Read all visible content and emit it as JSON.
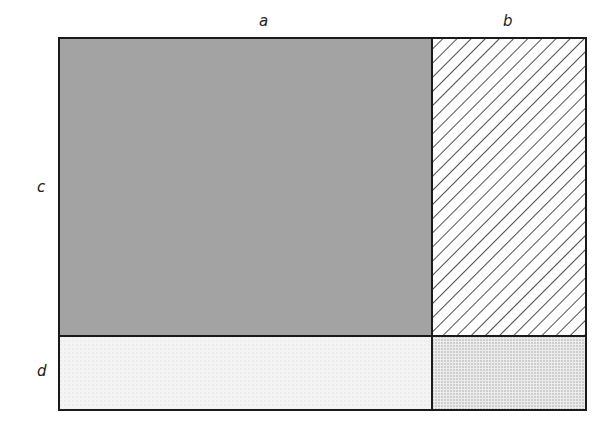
{
  "diagram": {
    "labels": {
      "a": "a",
      "b": "b",
      "c": "c",
      "d": "d"
    },
    "regions": [
      {
        "name": "ac",
        "fill": "solid",
        "color": "#a3a3a3"
      },
      {
        "name": "bc",
        "fill": "diagonal-hatch",
        "color": "#222222"
      },
      {
        "name": "ad",
        "fill": "light-dots",
        "color": "#f1f1f1"
      },
      {
        "name": "bd",
        "fill": "dense-dots",
        "color": "#dcdcdc"
      }
    ]
  }
}
